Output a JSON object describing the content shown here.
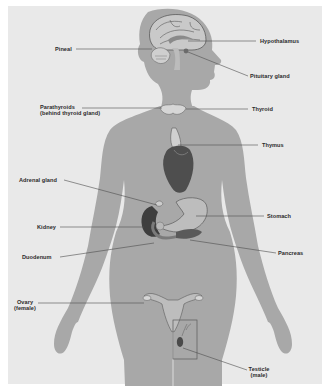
{
  "diagram": {
    "colors": {
      "page_background": "#ffffff",
      "panel_background": "#e9e9e9",
      "body_silhouette": "#a8a8a8",
      "organ_dark": "#4a4a4a",
      "organ_mid": "#7d7d7d",
      "organ_light": "#c9c9c9",
      "leader_line": "#4d4d4d",
      "label_text": "#2b2b2b"
    },
    "labels": {
      "pineal": "Pineal",
      "hypothalamus": "Hypothalamus",
      "pituitary": "Pituitary gland",
      "parathyroids_line1": "Parathyroids",
      "parathyroids_line2": "(behind thyroid gland)",
      "thyroid": "Thyroid",
      "thymus": "Thymus",
      "adrenal": "Adrenal gland",
      "stomach": "Stomach",
      "kidney": "Kidney",
      "pancreas": "Pancreas",
      "duodenum": "Duodenum",
      "ovary_line1": "Ovary",
      "ovary_line2": "(female)",
      "testicle_line1": "Testicle",
      "testicle_line2": "(male)"
    }
  }
}
